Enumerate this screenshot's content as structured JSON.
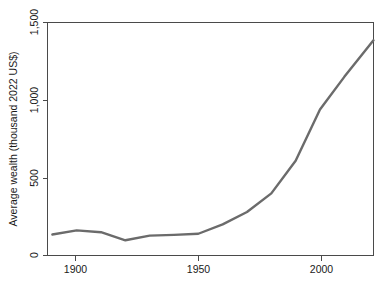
{
  "chart_data": {
    "type": "line",
    "title": "",
    "subtitle": "",
    "xlabel": "",
    "ylabel": "Average wealth (thousand 2022 US$)",
    "xlim": [
      1888,
      2022
    ],
    "ylim": [
      0,
      1500
    ],
    "xticks": [
      1900,
      1950,
      2000
    ],
    "xtick_labels": [
      "1900",
      "1950",
      "2000"
    ],
    "yticks": [
      0,
      500,
      1000,
      1500
    ],
    "ytick_labels": [
      "0",
      "500",
      "1,000",
      "1,500"
    ],
    "grid": false,
    "legend": "none",
    "series": [
      {
        "name": "Average wealth",
        "color": "#6b6b6b",
        "x": [
          1890,
          1900,
          1910,
          1920,
          1930,
          1940,
          1950,
          1960,
          1970,
          1980,
          1990,
          2000,
          2010,
          2022
        ],
        "values": [
          135,
          162,
          150,
          98,
          128,
          133,
          140,
          200,
          280,
          400,
          610,
          940,
          1150,
          1385
        ]
      }
    ]
  },
  "axis": {
    "y_title": "Average wealth (thousand 2022 US$)",
    "y_tick_0": "0",
    "y_tick_500": "500",
    "y_tick_1000": "1,000",
    "y_tick_1500": "1,500",
    "x_tick_1900": "1900",
    "x_tick_1950": "1950",
    "x_tick_2000": "2000"
  },
  "colors": {
    "line": "#6b6b6b",
    "axis": "#4a4a4a",
    "text": "#1a1a1a",
    "background": "#ffffff"
  }
}
